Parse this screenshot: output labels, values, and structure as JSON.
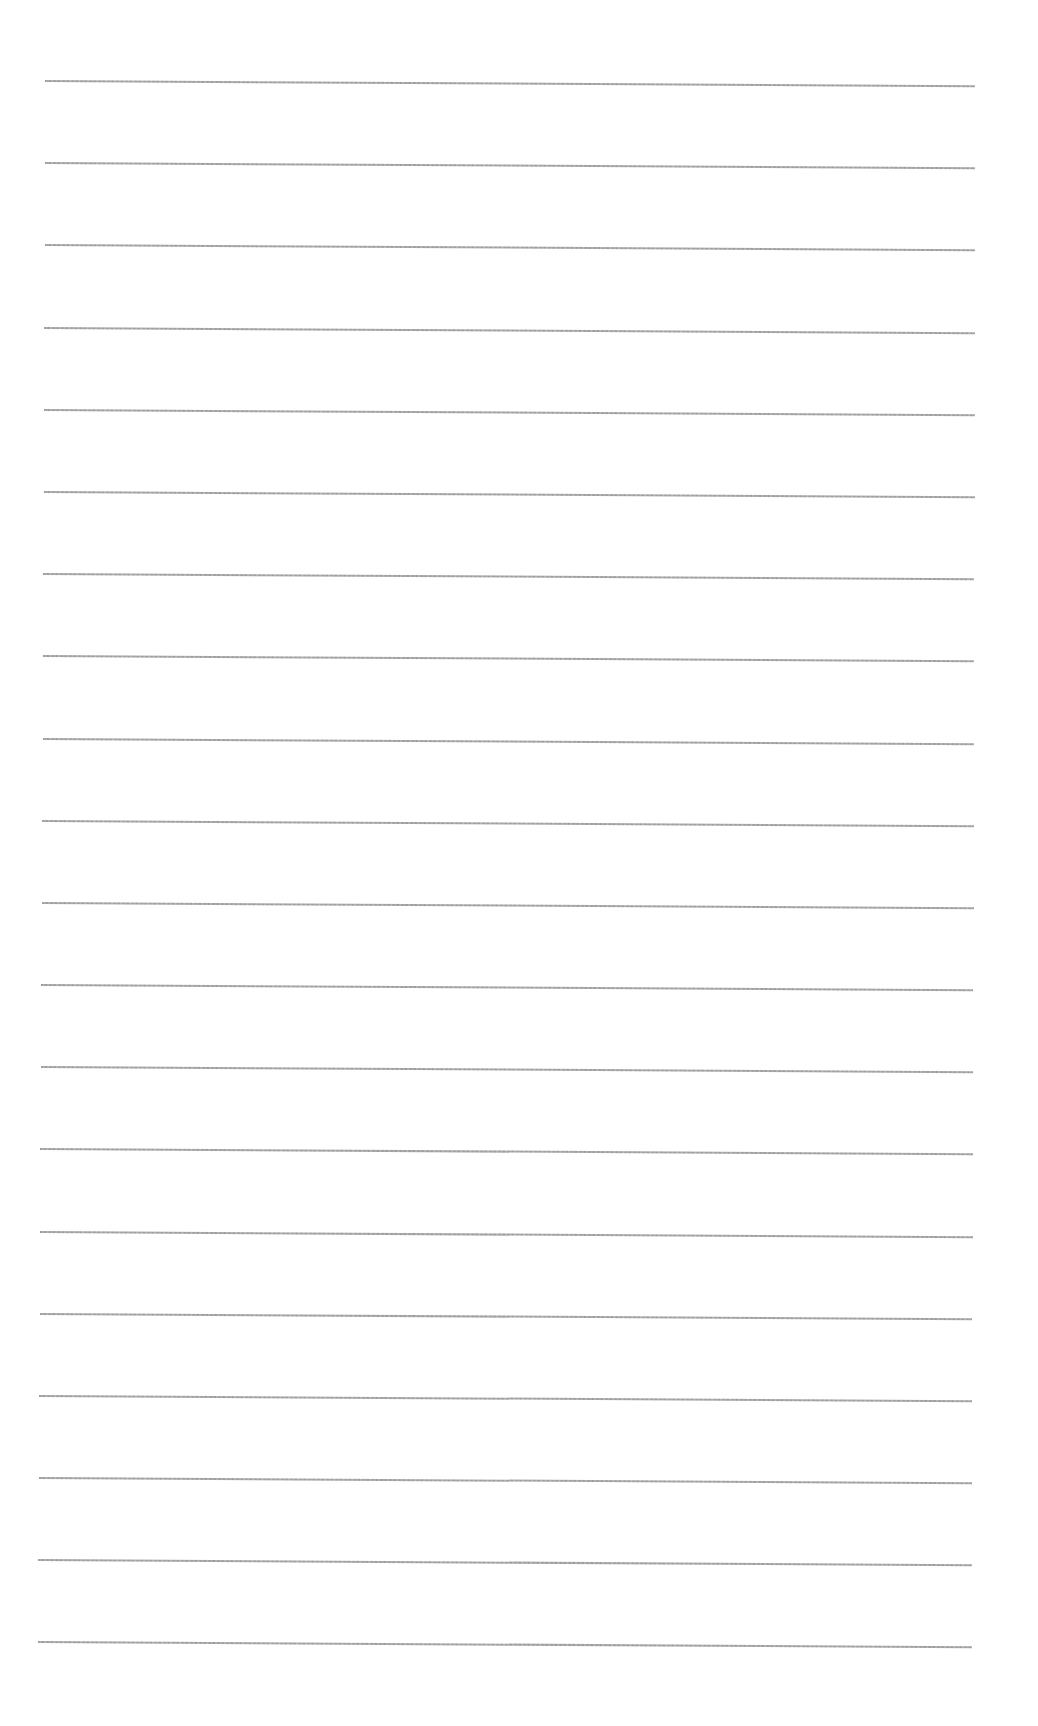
{
  "page": {
    "type": "ruled-paper",
    "background_color": "#ffffff",
    "line_color": "#9a9a9a",
    "line_count": 20,
    "line_spacing_px": 82.2,
    "first_line_y": 80,
    "tilt_deg": 0.32
  },
  "lines": [
    {
      "y": 80,
      "x_start": 45,
      "x_end": 975
    },
    {
      "y": 162,
      "x_start": 45,
      "x_end": 975
    },
    {
      "y": 244,
      "x_start": 45,
      "x_end": 975
    },
    {
      "y": 327,
      "x_start": 44,
      "x_end": 975
    },
    {
      "y": 409,
      "x_start": 44,
      "x_end": 975
    },
    {
      "y": 491,
      "x_start": 44,
      "x_end": 975
    },
    {
      "y": 573,
      "x_start": 43,
      "x_end": 974
    },
    {
      "y": 655,
      "x_start": 43,
      "x_end": 974
    },
    {
      "y": 738,
      "x_start": 43,
      "x_end": 974
    },
    {
      "y": 820,
      "x_start": 42,
      "x_end": 974
    },
    {
      "y": 902,
      "x_start": 42,
      "x_end": 974
    },
    {
      "y": 984,
      "x_start": 41,
      "x_end": 973
    },
    {
      "y": 1066,
      "x_start": 41,
      "x_end": 973
    },
    {
      "y": 1148,
      "x_start": 40,
      "x_end": 973
    },
    {
      "y": 1231,
      "x_start": 40,
      "x_end": 973
    },
    {
      "y": 1313,
      "x_start": 40,
      "x_end": 972
    },
    {
      "y": 1395,
      "x_start": 39,
      "x_end": 972
    },
    {
      "y": 1477,
      "x_start": 39,
      "x_end": 972
    },
    {
      "y": 1559,
      "x_start": 38,
      "x_end": 972
    },
    {
      "y": 1641,
      "x_start": 38,
      "x_end": 972
    }
  ]
}
